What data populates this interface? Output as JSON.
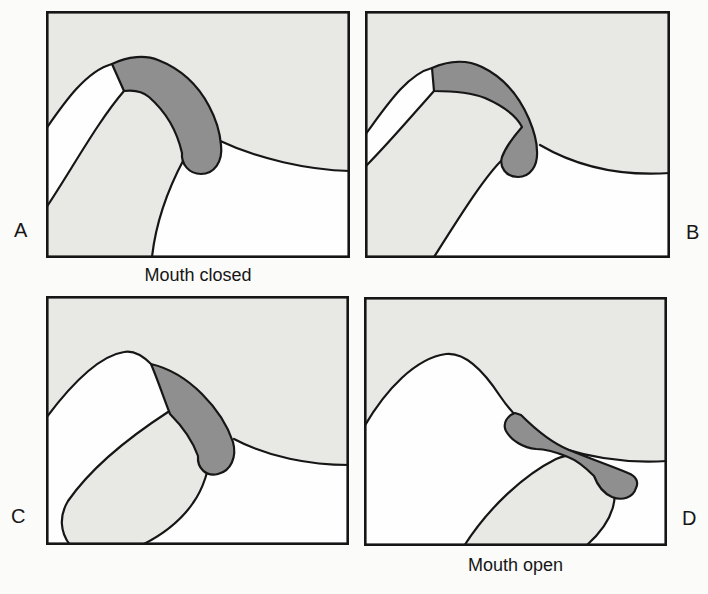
{
  "figure_labels": {
    "panel_a": "A",
    "panel_b": "B",
    "panel_c": "C",
    "panel_d": "D"
  },
  "captions": {
    "mouth_closed": "Mouth closed",
    "mouth_open": "Mouth open"
  },
  "colors": {
    "page_bg": "#fbfbfa",
    "panel_gray": "#e8e8e5",
    "bone_white": "#fefefe",
    "disc_gray": "#8f8f8f",
    "outline": "#161616"
  }
}
